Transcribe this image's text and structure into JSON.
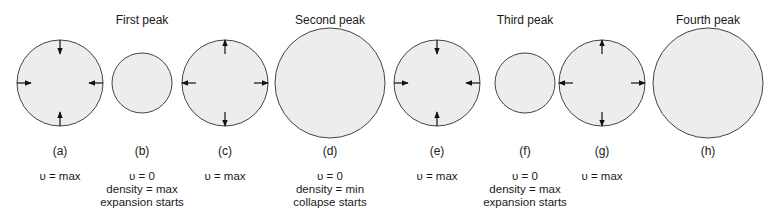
{
  "colors": {
    "circle_fill": "#ededed",
    "circle_stroke": "#444444",
    "arrow": "#111111",
    "text": "#1a1a1a"
  },
  "peak_titles": [
    {
      "label": "First peak",
      "x": 142
    },
    {
      "label": "Second peak",
      "x": 330
    },
    {
      "label": "Third peak",
      "x": 525
    },
    {
      "label": "Fourth peak",
      "x": 708
    }
  ],
  "panels": [
    {
      "letter": "(a)",
      "cx": 60,
      "r": 43,
      "arrows": "inward",
      "desc": [
        "υ = max"
      ]
    },
    {
      "letter": "(b)",
      "cx": 142,
      "r": 30,
      "arrows": "none",
      "desc": [
        "υ = 0",
        "density = max",
        "expansion starts"
      ]
    },
    {
      "letter": "(c)",
      "cx": 225,
      "r": 43,
      "arrows": "outward",
      "desc": [
        "υ = max"
      ]
    },
    {
      "letter": "(d)",
      "cx": 330,
      "r": 55,
      "arrows": "none",
      "desc": [
        "υ = 0",
        "density = min",
        "collapse starts"
      ]
    },
    {
      "letter": "(e)",
      "cx": 437,
      "r": 43,
      "arrows": "inward",
      "desc": [
        "υ = max"
      ]
    },
    {
      "letter": "(f)",
      "cx": 525,
      "r": 30,
      "arrows": "none",
      "desc": [
        "υ = 0",
        "density = max",
        "expansion starts"
      ]
    },
    {
      "letter": "(g)",
      "cx": 602,
      "r": 43,
      "arrows": "outward",
      "desc": [
        "υ = max"
      ]
    },
    {
      "letter": "(h)",
      "cx": 708,
      "r": 55,
      "arrows": "none",
      "desc": []
    }
  ],
  "circle_cy": 83
}
